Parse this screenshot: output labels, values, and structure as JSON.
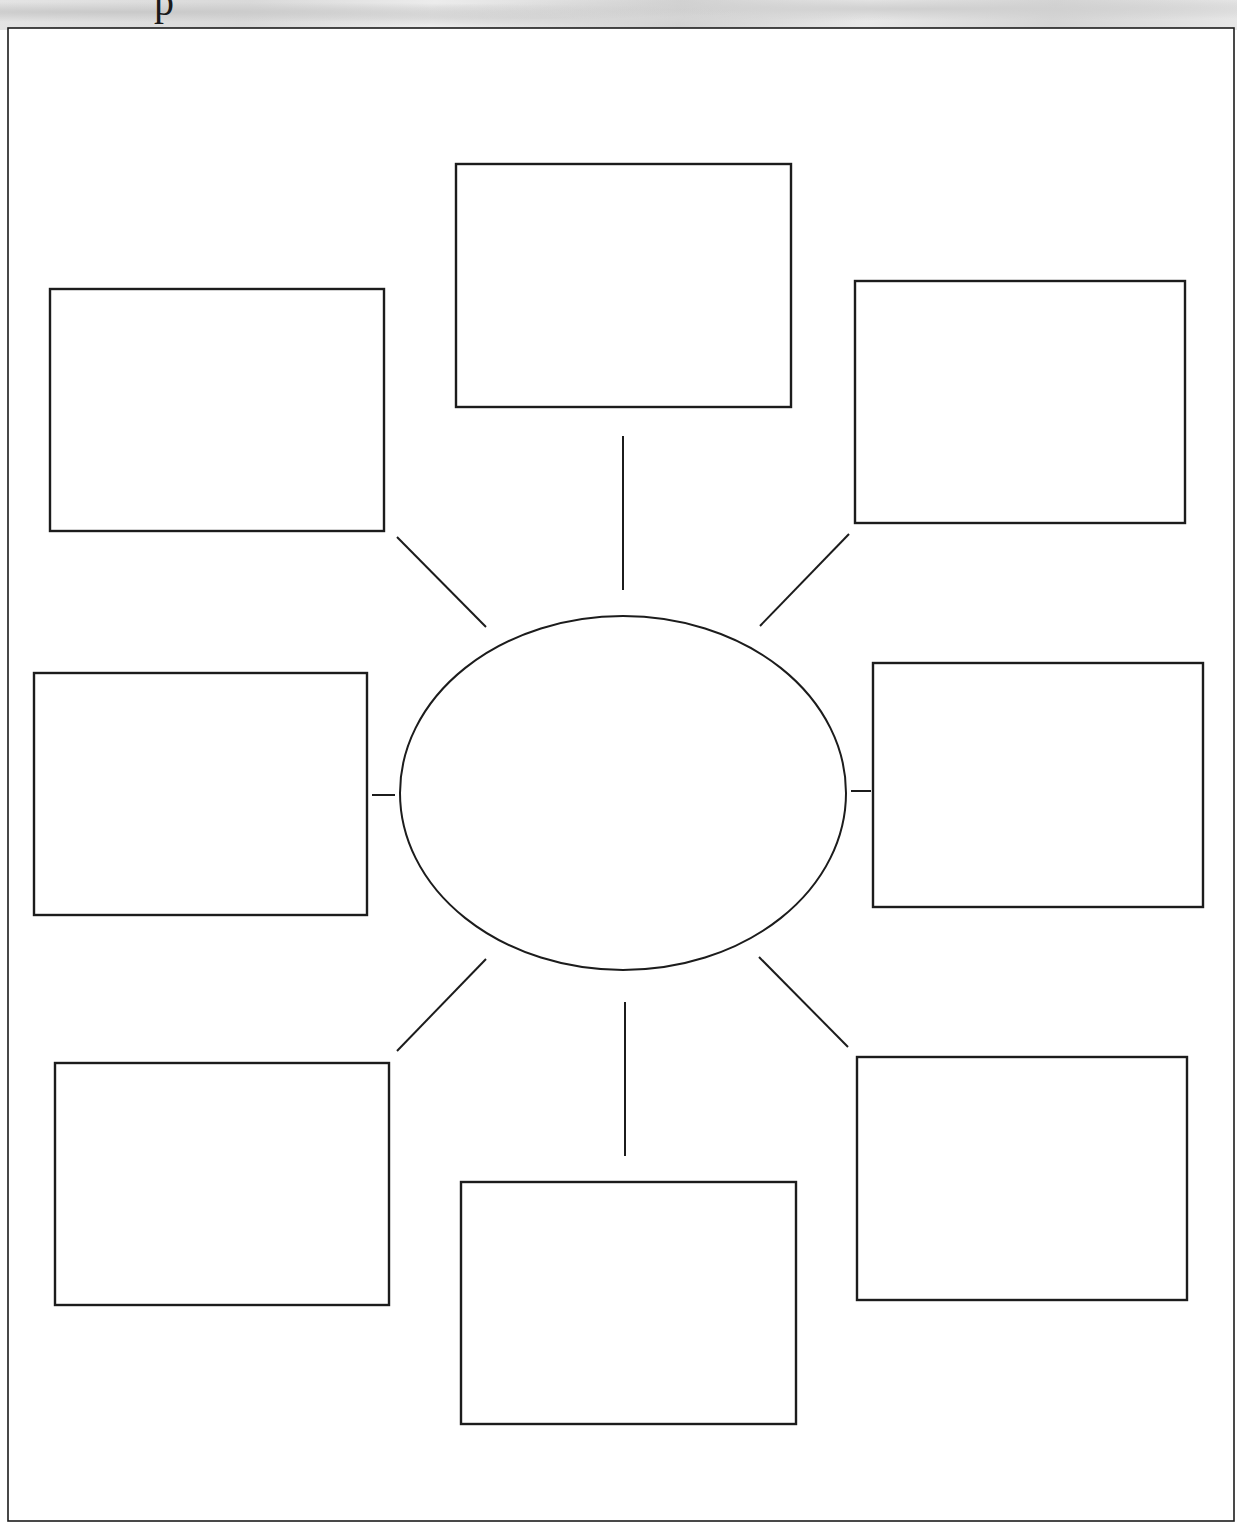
{
  "header": {
    "clipped_title_glyph": "p"
  },
  "colors": {
    "stroke": "#1c1c1c",
    "paper": "#ffffff",
    "header_band": "#dcdcdc"
  },
  "diagram": {
    "type": "web-graphic-organizer",
    "frame": {
      "x1": 8,
      "y1": 28,
      "x2": 1234,
      "y2": 1521
    },
    "center_ellipse": {
      "cx": 623,
      "cy": 793,
      "rx": 223,
      "ry": 177,
      "label": ""
    },
    "boxes": [
      {
        "id": "top",
        "x": 456,
        "y": 164,
        "w": 335,
        "h": 243,
        "label": ""
      },
      {
        "id": "top-left",
        "x": 50,
        "y": 289,
        "w": 334,
        "h": 242,
        "label": ""
      },
      {
        "id": "top-right",
        "x": 855,
        "y": 281,
        "w": 330,
        "h": 242,
        "label": ""
      },
      {
        "id": "left",
        "x": 34,
        "y": 673,
        "w": 333,
        "h": 242,
        "label": ""
      },
      {
        "id": "right",
        "x": 873,
        "y": 663,
        "w": 330,
        "h": 244,
        "label": ""
      },
      {
        "id": "bottom-left",
        "x": 55,
        "y": 1063,
        "w": 334,
        "h": 242,
        "label": ""
      },
      {
        "id": "bottom",
        "x": 461,
        "y": 1182,
        "w": 335,
        "h": 242,
        "label": ""
      },
      {
        "id": "bottom-right",
        "x": 857,
        "y": 1057,
        "w": 330,
        "h": 243,
        "label": ""
      }
    ],
    "connectors": [
      {
        "to": "top",
        "x1": 623,
        "y1": 436,
        "x2": 623,
        "y2": 590
      },
      {
        "to": "top-left",
        "x1": 397,
        "y1": 537,
        "x2": 486,
        "y2": 627
      },
      {
        "to": "top-right",
        "x1": 849,
        "y1": 534,
        "x2": 760,
        "y2": 626
      },
      {
        "to": "left",
        "x1": 372,
        "y1": 795,
        "x2": 395,
        "y2": 795
      },
      {
        "to": "right",
        "x1": 851,
        "y1": 791,
        "x2": 871,
        "y2": 791
      },
      {
        "to": "bottom-left",
        "x1": 486,
        "y1": 959,
        "x2": 397,
        "y2": 1051
      },
      {
        "to": "bottom",
        "x1": 625,
        "y1": 1002,
        "x2": 625,
        "y2": 1156
      },
      {
        "to": "bottom-right",
        "x1": 759,
        "y1": 957,
        "x2": 848,
        "y2": 1047
      }
    ]
  }
}
